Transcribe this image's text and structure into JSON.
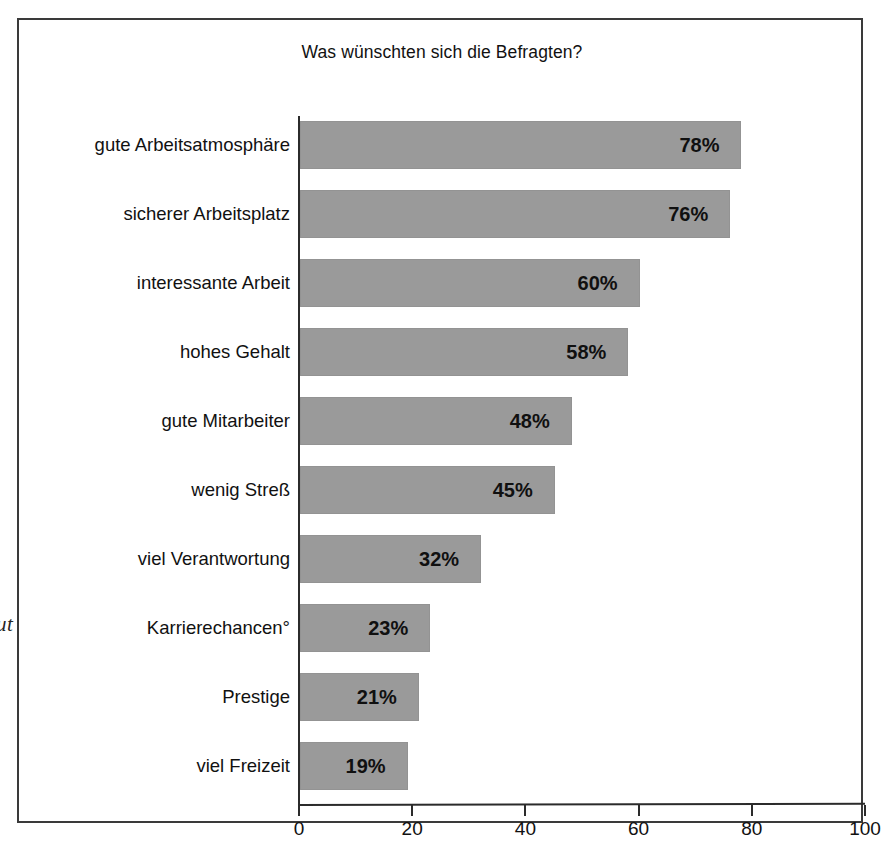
{
  "bleed_fragment": "ut",
  "chart_data": {
    "type": "bar",
    "orientation": "horizontal",
    "title": "Was wünschten sich die Befragten?",
    "xlabel": "",
    "ylabel": "",
    "xlim": [
      0,
      100
    ],
    "xticks": [
      0,
      20,
      40,
      60,
      80,
      100
    ],
    "xtick_labels": [
      "0",
      "20",
      "40",
      "60",
      "80",
      "100"
    ],
    "grid": false,
    "legend": "none",
    "value_suffix": "%",
    "bar_color": "#9a9a9a",
    "axis_color": "#2b2b2b",
    "frame_color": "#3a3a3a",
    "categories": [
      "gute Arbeitsatmosphäre",
      "sicherer Arbeitsplatz",
      "interessante Arbeit",
      "hohes Gehalt",
      "gute Mitarbeiter",
      "wenig Streß",
      "viel Verantwortung",
      "Karrierechancen°",
      "Prestige",
      "viel Freizeit"
    ],
    "values": [
      78,
      76,
      60,
      58,
      48,
      45,
      32,
      23,
      21,
      19
    ],
    "data_labels": [
      "78%",
      "76%",
      "60%",
      "58%",
      "48%",
      "45%",
      "32%",
      "23%",
      "21%",
      "19%"
    ]
  }
}
